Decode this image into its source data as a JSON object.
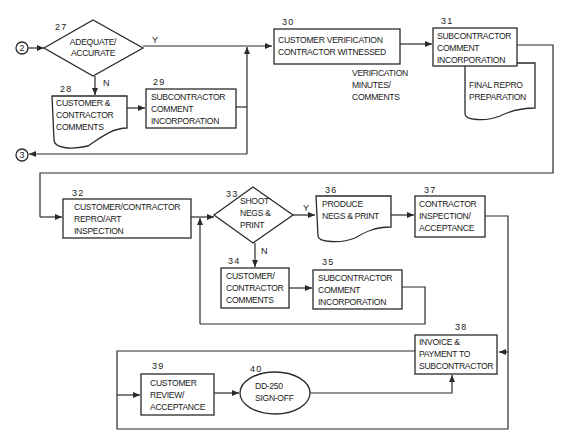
{
  "diagram": {
    "type": "flowchart",
    "connectors": [
      {
        "id": "conn-2",
        "label": "2"
      },
      {
        "id": "conn-3",
        "label": "3"
      }
    ],
    "nodes": {
      "n27": {
        "number": "27",
        "shape": "decision",
        "lines": [
          "ADEQUATE/",
          "ACCURATE"
        ]
      },
      "n28": {
        "number": "28",
        "shape": "document",
        "lines": [
          "CUSTOMER &",
          "CONTRACTOR",
          "COMMENTS"
        ]
      },
      "n29": {
        "number": "29",
        "shape": "process",
        "lines": [
          "SUBCONTRACTOR",
          "COMMENT",
          "INCORPORATION"
        ]
      },
      "n30": {
        "number": "30",
        "shape": "process",
        "lines": [
          "CUSTOMER VERIFICATION",
          "CONTRACTOR WITNESSED"
        ]
      },
      "n30_note": {
        "lines": [
          "VERIFICATION",
          "MINUTES/",
          "COMMENTS"
        ]
      },
      "n31": {
        "number": "31",
        "shape": "process",
        "lines": [
          "SUBCONTRACTOR",
          "COMMENT",
          "INCORPORATION"
        ]
      },
      "n31_doc": {
        "shape": "document",
        "lines": [
          "FINAL REPRO",
          "PREPARATION"
        ]
      },
      "n32": {
        "number": "32",
        "shape": "process",
        "lines": [
          "CUSTOMER/CONTRACTOR",
          "REPRO/ART",
          "INSPECTION"
        ]
      },
      "n33": {
        "number": "33",
        "shape": "decision",
        "lines": [
          "SHOOT",
          "NEGS &",
          "PRINT"
        ]
      },
      "n34": {
        "number": "34",
        "shape": "process",
        "lines": [
          "CUSTOMER/",
          "CONTRACTOR",
          "COMMENTS"
        ]
      },
      "n35": {
        "number": "35",
        "shape": "process",
        "lines": [
          "SUBCONTRACTOR",
          "COMMENT",
          "INCORPORATION"
        ]
      },
      "n36": {
        "number": "36",
        "shape": "document",
        "lines": [
          "PRODUCE",
          "NEGS & PRINT"
        ]
      },
      "n37": {
        "number": "37",
        "shape": "process",
        "lines": [
          "CONTRACTOR",
          "INSPECTION/",
          "ACCEPTANCE"
        ]
      },
      "n38": {
        "number": "38",
        "shape": "process",
        "lines": [
          "INVOICE &",
          "PAYMENT TO",
          "SUBCONTRACTOR"
        ]
      },
      "n39": {
        "number": "39",
        "shape": "process",
        "lines": [
          "CUSTOMER",
          "REVIEW/",
          "ACCEPTANCE"
        ]
      },
      "n40": {
        "number": "40",
        "shape": "terminator",
        "lines": [
          "DD-250",
          "SIGN-OFF"
        ]
      }
    },
    "edge_labels": {
      "y27": "Y",
      "n27": "N",
      "y33": "Y",
      "n33": "N"
    },
    "colors": {
      "stroke": "#2a2a2a",
      "background": "#ffffff"
    }
  }
}
